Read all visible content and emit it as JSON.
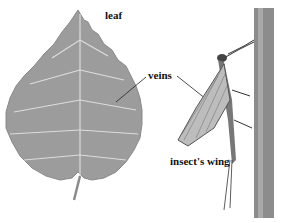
{
  "labels": {
    "leaf": "leaf",
    "veins": "veins",
    "insect_wing": "insect's wing"
  },
  "colors": {
    "leaf_fill": "#9a9a9a",
    "leaf_vein": "#d8d8d8",
    "stem": "#7a7a7a",
    "wing": "#b8b8b8",
    "text": "#111111"
  }
}
